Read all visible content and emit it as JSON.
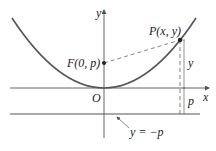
{
  "diagram": {
    "axes": {
      "x_label": "x",
      "y_label": "y",
      "origin_label": "O"
    },
    "focus": {
      "label": "F(0, p)"
    },
    "point": {
      "label": "P(x, y)"
    },
    "directrix": {
      "label": "y = −p"
    },
    "distances": {
      "upper_label": "y",
      "lower_label": "p"
    },
    "colors": {
      "curve": "#555555",
      "axes": "#555555",
      "text": "#222222",
      "background": "#ffffff"
    }
  }
}
